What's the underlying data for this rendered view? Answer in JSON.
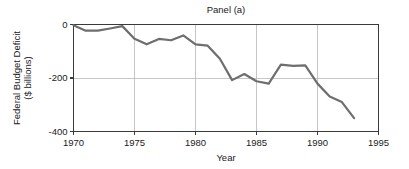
{
  "chart_data": {
    "type": "line",
    "title": "Panel (a)",
    "xlabel": "Year",
    "ylabel": "Federal Budget Deficit ($ billions)",
    "ylabel_line1": "Federal Budget Deficit",
    "ylabel_line2": "($ billions)",
    "xlim": [
      1970,
      1995
    ],
    "ylim": [
      -400,
      0
    ],
    "xticks": [
      1970,
      1975,
      1980,
      1985,
      1990,
      1995
    ],
    "xtick_labels": [
      "1970",
      "1975",
      "1980",
      "1985",
      "1990",
      "1995"
    ],
    "yticks": [
      0,
      -200,
      -400
    ],
    "ytick_labels": [
      "0",
      "-200",
      "-400"
    ],
    "grid": true,
    "grid_color": "#b8b8b8",
    "legend": null,
    "line_color": "#6e6e6e",
    "axis_color": "#3a3a3a",
    "background": "#ffffff",
    "x": [
      1970,
      1971,
      1972,
      1973,
      1974,
      1975,
      1976,
      1977,
      1978,
      1979,
      1980,
      1981,
      1982,
      1983,
      1984,
      1985,
      1986,
      1987,
      1988,
      1989,
      1990,
      1991,
      1992,
      1993
    ],
    "values": [
      -3,
      -23,
      -23,
      -15,
      -6,
      -53,
      -74,
      -54,
      -59,
      -41,
      -74,
      -79,
      -128,
      -208,
      -185,
      -212,
      -221,
      -150,
      -155,
      -153,
      -221,
      -269,
      -290,
      -350
    ],
    "series": [
      {
        "name": "Federal Budget Deficit",
        "values": [
          -3,
          -23,
          -23,
          -15,
          -6,
          -53,
          -74,
          -54,
          -59,
          -41,
          -74,
          -79,
          -128,
          -208,
          -185,
          -212,
          -221,
          -150,
          -155,
          -153,
          -221,
          -269,
          -290,
          -350
        ]
      }
    ]
  }
}
